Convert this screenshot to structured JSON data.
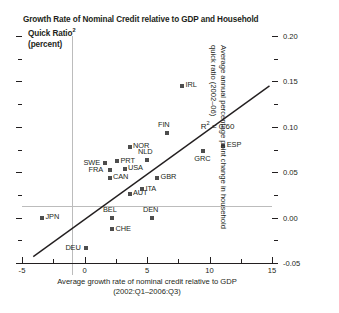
{
  "chart_data": {
    "type": "scatter",
    "title_lines": [
      "Growth Rate of Nominal Credit relative to GDP and Household",
      "Quick Ratio",
      "(percent)"
    ],
    "title_superscript": "2",
    "xlabel_lines": [
      "Average growth rate of nominal credit relative to GDP",
      "(2002:Q1–2006:Q3)"
    ],
    "ylabel_lines": [
      "Average annual percentage point change in household",
      "quick ratio (2002–06)"
    ],
    "xlim": [
      -5,
      15
    ],
    "ylim": [
      -0.05,
      0.2
    ],
    "xticks": [
      -5,
      0,
      5,
      10,
      15
    ],
    "xtick_labels": [
      "-5",
      "0",
      "5",
      "10",
      "15"
    ],
    "yticks": [
      -0.05,
      0.0,
      0.05,
      0.1,
      0.15,
      0.2
    ],
    "ytick_labels": [
      "-0.05",
      "0.00",
      "0.05",
      "0.10",
      "0.15",
      "0.20"
    ],
    "grid": false,
    "legend": "none",
    "annotation": {
      "r2_text": "R",
      "r2_sup": "2",
      "r2_value": "= 0.60"
    },
    "regression_line": {
      "x_start": -4.1,
      "y_start": -0.043,
      "x_end": 14.8,
      "y_end": 0.145
    },
    "points": [
      {
        "label": "IRL",
        "x": 7.8,
        "y": 0.145,
        "label_pos": "right"
      },
      {
        "label": "FIN",
        "x": 6.6,
        "y": 0.093,
        "label_pos": "above"
      },
      {
        "label": "ESP",
        "x": 11.1,
        "y": 0.079,
        "label_pos": "right"
      },
      {
        "label": "GRC",
        "x": 9.5,
        "y": 0.073,
        "label_pos": "below"
      },
      {
        "label": "NOR",
        "x": 3.6,
        "y": 0.078,
        "label_pos": "right"
      },
      {
        "label": "NLD",
        "x": 5.0,
        "y": 0.063,
        "label_pos": "above"
      },
      {
        "label": "PRT",
        "x": 2.6,
        "y": 0.062,
        "label_pos": "right"
      },
      {
        "label": "USA",
        "x": 3.2,
        "y": 0.054,
        "label_pos": "right"
      },
      {
        "label": "SWE",
        "x": 1.6,
        "y": 0.06,
        "label_pos": "left"
      },
      {
        "label": "FRA",
        "x": 2.0,
        "y": 0.052,
        "label_pos": "left"
      },
      {
        "label": "CAN",
        "x": 2.0,
        "y": 0.044,
        "label_pos": "right"
      },
      {
        "label": "GBR",
        "x": 5.8,
        "y": 0.044,
        "label_pos": "right"
      },
      {
        "label": "AUT",
        "x": 3.6,
        "y": 0.026,
        "label_pos": "right"
      },
      {
        "label": "ITA",
        "x": 4.6,
        "y": 0.031,
        "label_pos": "right"
      },
      {
        "label": "BEL",
        "x": 2.2,
        "y": 0.0,
        "label_pos": "above"
      },
      {
        "label": "DEN",
        "x": 5.4,
        "y": 0.0,
        "label_pos": "above"
      },
      {
        "label": "JPN",
        "x": -3.4,
        "y": 0.0,
        "label_pos": "right"
      },
      {
        "label": "CHE",
        "x": 2.2,
        "y": -0.013,
        "label_pos": "right"
      },
      {
        "label": "DEU",
        "x": 0.15,
        "y": -0.034,
        "label_pos": "left"
      }
    ]
  }
}
